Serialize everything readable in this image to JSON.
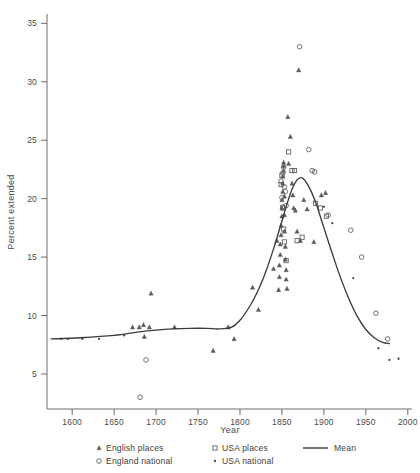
{
  "chart_data": {
    "type": "scatter",
    "title": "",
    "xlabel": "Year",
    "ylabel": "Percent  extended",
    "xlim": [
      1570,
      2005
    ],
    "ylim": [
      2.0,
      35.8
    ],
    "grid": false,
    "legend_position": "bottom",
    "xticks": [
      1600,
      1650,
      1700,
      1750,
      1800,
      1850,
      1900,
      1950,
      2000
    ],
    "xtick_labels": [
      "1600",
      "1650",
      "1700",
      "1750",
      "1800",
      "1850",
      "1900",
      "1950",
      "2000"
    ],
    "yticks": [
      5,
      10,
      15,
      20,
      25,
      30,
      35
    ],
    "ytick_labels": [
      "5",
      "10",
      "15",
      "20",
      "25",
      "30",
      "35"
    ],
    "series": [
      {
        "name": "English places",
        "marker": "triangle",
        "points": [
          [
            1672,
            9.0
          ],
          [
            1680,
            9.0
          ],
          [
            1685,
            9.2
          ],
          [
            1686,
            8.2
          ],
          [
            1692,
            9.0
          ],
          [
            1694,
            11.9
          ],
          [
            1722,
            9.0
          ],
          [
            1768,
            7.0
          ],
          [
            1786,
            9.0
          ],
          [
            1793,
            8.0
          ],
          [
            1815,
            12.4
          ],
          [
            1822,
            10.5
          ],
          [
            1840,
            14.0
          ],
          [
            1844,
            16.4
          ],
          [
            1846,
            12.2
          ],
          [
            1847,
            13.3
          ],
          [
            1847,
            14.3
          ],
          [
            1848,
            15.2
          ],
          [
            1848,
            16.1
          ],
          [
            1849,
            16.9
          ],
          [
            1849,
            17.7
          ],
          [
            1850,
            18.5
          ],
          [
            1850,
            19.2
          ],
          [
            1850,
            19.9
          ],
          [
            1851,
            20.6
          ],
          [
            1851,
            21.3
          ],
          [
            1851,
            21.9
          ],
          [
            1852,
            22.4
          ],
          [
            1852,
            22.8
          ],
          [
            1852,
            23.1
          ],
          [
            1853,
            20.2
          ],
          [
            1853,
            18.6
          ],
          [
            1853,
            17.2
          ],
          [
            1854,
            15.9
          ],
          [
            1854,
            14.8
          ],
          [
            1855,
            13.9
          ],
          [
            1855,
            13.1
          ],
          [
            1856,
            12.3
          ],
          [
            1857,
            27.0
          ],
          [
            1858,
            23.0
          ],
          [
            1860,
            25.3
          ],
          [
            1862,
            21.3
          ],
          [
            1863,
            20.3
          ],
          [
            1864,
            19.2
          ],
          [
            1866,
            19.0
          ],
          [
            1868,
            17.2
          ],
          [
            1870,
            31.0
          ],
          [
            1872,
            16.4
          ],
          [
            1876,
            19.9
          ],
          [
            1880,
            19.1
          ],
          [
            1888,
            16.3
          ],
          [
            1897,
            20.3
          ],
          [
            1902,
            20.5
          ]
        ]
      },
      {
        "name": "England national",
        "marker": "circle",
        "points": [
          [
            1681,
            3.0
          ],
          [
            1688,
            6.2
          ],
          [
            1849,
            21.5
          ],
          [
            1850,
            20.1
          ],
          [
            1851,
            19.3
          ],
          [
            1851,
            22.2
          ],
          [
            1852,
            22.7
          ],
          [
            1853,
            21.0
          ],
          [
            1854,
            20.6
          ],
          [
            1855,
            19.4
          ],
          [
            1871,
            33.0
          ],
          [
            1882,
            24.2
          ],
          [
            1886,
            22.4
          ],
          [
            1889,
            22.3
          ],
          [
            1905,
            18.6
          ],
          [
            1932,
            17.3
          ],
          [
            1945,
            15.0
          ],
          [
            1962,
            10.2
          ],
          [
            1976,
            8.0
          ]
        ]
      },
      {
        "name": "USA places",
        "marker": "square",
        "points": [
          [
            1849,
            21.2
          ],
          [
            1850,
            22.0
          ],
          [
            1851,
            19.2
          ],
          [
            1852,
            17.4
          ],
          [
            1853,
            16.3
          ],
          [
            1855,
            14.7
          ],
          [
            1858,
            24.0
          ],
          [
            1862,
            22.4
          ],
          [
            1865,
            22.4
          ],
          [
            1868,
            16.4
          ],
          [
            1874,
            16.7
          ],
          [
            1890,
            19.6
          ],
          [
            1896,
            19.2
          ],
          [
            1903,
            18.5
          ]
        ]
      },
      {
        "name": "USA national",
        "marker": "dot",
        "points": [
          [
            1587,
            8.0
          ],
          [
            1595,
            8.0
          ],
          [
            1612,
            8.0
          ],
          [
            1632,
            8.0
          ],
          [
            1662,
            8.3
          ],
          [
            1900,
            19.3
          ],
          [
            1910,
            17.9
          ],
          [
            1935,
            13.2
          ],
          [
            1965,
            7.2
          ],
          [
            1978,
            6.2
          ],
          [
            1989,
            6.3
          ]
        ]
      }
    ],
    "mean_curve": {
      "name": "Mean",
      "style": "line",
      "points": [
        [
          1575,
          8.0
        ],
        [
          1610,
          8.1
        ],
        [
          1650,
          8.3
        ],
        [
          1680,
          8.6
        ],
        [
          1700,
          8.75
        ],
        [
          1720,
          8.85
        ],
        [
          1740,
          8.9
        ],
        [
          1760,
          8.9
        ],
        [
          1775,
          8.85
        ],
        [
          1790,
          9.0
        ],
        [
          1800,
          9.6
        ],
        [
          1810,
          10.6
        ],
        [
          1820,
          11.9
        ],
        [
          1830,
          13.6
        ],
        [
          1840,
          15.7
        ],
        [
          1848,
          17.6
        ],
        [
          1855,
          19.3
        ],
        [
          1862,
          20.8
        ],
        [
          1868,
          21.6
        ],
        [
          1873,
          21.8
        ],
        [
          1878,
          21.5
        ],
        [
          1885,
          20.6
        ],
        [
          1892,
          19.3
        ],
        [
          1900,
          17.5
        ],
        [
          1910,
          15.3
        ],
        [
          1920,
          13.2
        ],
        [
          1930,
          11.4
        ],
        [
          1940,
          9.9
        ],
        [
          1950,
          8.8
        ],
        [
          1960,
          8.1
        ],
        [
          1970,
          7.7
        ],
        [
          1978,
          7.6
        ]
      ]
    },
    "legend_entries": [
      {
        "label": "English places",
        "marker": "triangle"
      },
      {
        "label": "USA places",
        "marker": "square"
      },
      {
        "label": "Mean",
        "marker": "line"
      },
      {
        "label": "England national",
        "marker": "circle"
      },
      {
        "label": "USA national",
        "marker": "dot"
      }
    ]
  },
  "axes": {
    "xlabel": "Year",
    "ylabel": "Percent  extended"
  },
  "legend": {
    "english_places": "English places",
    "usa_places": "USA places",
    "mean": "Mean",
    "england_national": "England national",
    "usa_national": "USA national"
  },
  "colors": {
    "axis": "#6e6e6e",
    "text": "#4a4a4a",
    "curve": "#3c3c3c",
    "marker": "#5a5a5a",
    "background": "#ffffff"
  }
}
